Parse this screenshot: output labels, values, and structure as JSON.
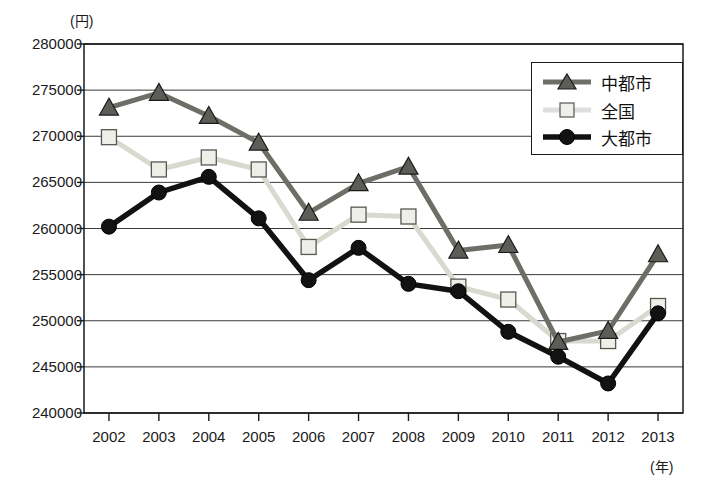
{
  "chart_data": {
    "type": "line",
    "title": "",
    "xlabel": "(年)",
    "ylabel": "(円)",
    "categories": [
      "2002",
      "2003",
      "2004",
      "2005",
      "2006",
      "2007",
      "2008",
      "2009",
      "2010",
      "2011",
      "2012",
      "2013"
    ],
    "ylim": [
      240000,
      280000
    ],
    "ytick_values": [
      280000,
      275000,
      270000,
      265000,
      260000,
      255000,
      250000,
      245000,
      240000
    ],
    "ytick_labels": [
      "280000",
      "275000",
      "270000",
      "265000",
      "260000",
      "255000",
      "250000",
      "245000",
      "240000"
    ],
    "grid": true,
    "legend_position": "top-right",
    "series": [
      {
        "name": "中都市",
        "marker": "triangle",
        "color": "#6e6e68",
        "values": [
          273100,
          274700,
          272200,
          269300,
          261700,
          264900,
          266700,
          257600,
          258200,
          247700,
          248900,
          257200
        ]
      },
      {
        "name": "全国",
        "marker": "square",
        "color": "#d9d9d0",
        "values": [
          269900,
          266400,
          267700,
          266400,
          258000,
          261500,
          261300,
          253700,
          252300,
          247800,
          247800,
          251600
        ]
      },
      {
        "name": "大都市",
        "marker": "circle",
        "color": "#121212",
        "values": [
          260200,
          263900,
          265600,
          261100,
          254400,
          257900,
          254000,
          253200,
          248800,
          246100,
          243200,
          250800
        ]
      }
    ]
  },
  "legend": {
    "items": [
      {
        "label": "中都市"
      },
      {
        "label": "全国"
      },
      {
        "label": "大都市"
      }
    ]
  },
  "axis": {
    "y_unit": "(円)",
    "x_unit": "(年)"
  },
  "colors": {
    "series_mid_city": "#6e6e68",
    "series_national": "#d9d9d0",
    "series_big_city": "#121212",
    "axis": "#1a1a1a",
    "grid": "#3a3a3a"
  }
}
